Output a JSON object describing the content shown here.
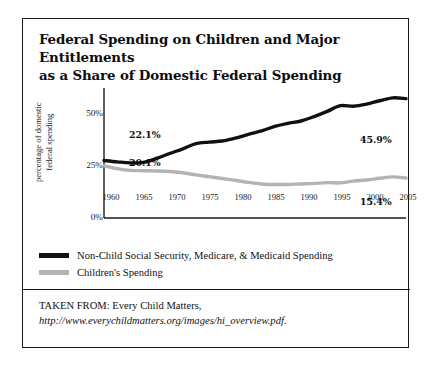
{
  "figure": {
    "title_line1": "Federal Spending on Children and Major Entitlements",
    "title_line2": "as a Share of Domestic Federal Spending",
    "source_prefix": "TAKEN FROM: Every Child Matters,",
    "source_url": "http://www.everychildmatters.org/images/hi_overview.pdf."
  },
  "colors": {
    "series_black": "#111111",
    "series_gray": "#b3b3b3",
    "axis": "#1a1a1a",
    "frame": "#1a1a1a",
    "text": "#111111",
    "background": "#ffffff"
  },
  "chart_data": {
    "type": "line",
    "title": "Federal Spending on Children and Major Entitlements as a Share of Domestic Federal Spending",
    "xlabel": "",
    "ylabel": "percentage of domestic federal spending",
    "ylabel_line1": "percentage of domestic",
    "ylabel_line2": "federal spending",
    "xlim": [
      1960,
      2006
    ],
    "ylim": [
      0,
      50
    ],
    "yticks": [
      0,
      25,
      50
    ],
    "ytick_labels": [
      "0%",
      "25%",
      "50%"
    ],
    "xticks": [
      1960,
      1965,
      1970,
      1975,
      1980,
      1985,
      1990,
      1995,
      2000,
      2005
    ],
    "xtick_labels": [
      "1960",
      "1965",
      "1970",
      "1975",
      "1980",
      "1985",
      "1990",
      "1995",
      "2000",
      "2005"
    ],
    "grid": false,
    "legend_position": "below",
    "annotations": [
      {
        "text": "22.1%",
        "series": "Non-Child Social Security, Medicare, & Medicaid Spending",
        "x": 1960,
        "y": 22.1,
        "placement": "above-right"
      },
      {
        "text": "20.1%",
        "series": "Children's Spending",
        "x": 1960,
        "y": 20.1,
        "placement": "below-right"
      },
      {
        "text": "45.9%",
        "series": "Non-Child Social Security, Medicare, & Medicaid Spending",
        "x": 2006,
        "y": 45.9,
        "placement": "below-left"
      },
      {
        "text": "15.4%",
        "series": "Children's Spending",
        "x": 2006,
        "y": 15.4,
        "placement": "below-left"
      }
    ],
    "series": [
      {
        "name": "Non-Child Social Security, Medicare, & Medicaid Spending",
        "color": "#111111",
        "x": [
          1960,
          1962,
          1964,
          1966,
          1968,
          1970,
          1972,
          1974,
          1976,
          1978,
          1980,
          1982,
          1984,
          1986,
          1988,
          1990,
          1992,
          1994,
          1996,
          1998,
          2000,
          2002,
          2004,
          2006
        ],
        "values": [
          22.1,
          21.6,
          21.2,
          21.4,
          22.9,
          24.8,
          26.6,
          28.6,
          29.2,
          29.6,
          30.7,
          32.2,
          33.5,
          35.2,
          36.4,
          37.3,
          39.0,
          41.0,
          43.2,
          43.0,
          43.8,
          45.1,
          46.2,
          45.9
        ]
      },
      {
        "name": "Children's Spending",
        "color": "#b3b3b3",
        "x": [
          1960,
          1962,
          1964,
          1966,
          1968,
          1970,
          1972,
          1974,
          1976,
          1978,
          1980,
          1982,
          1984,
          1986,
          1988,
          1990,
          1992,
          1994,
          1996,
          1998,
          2000,
          2002,
          2004,
          2006
        ],
        "values": [
          20.1,
          19.0,
          18.3,
          18.2,
          18.1,
          17.9,
          17.4,
          16.6,
          15.9,
          15.2,
          14.5,
          13.7,
          13.1,
          12.9,
          12.9,
          13.1,
          13.3,
          13.6,
          13.5,
          14.2,
          14.6,
          15.3,
          15.8,
          15.4
        ]
      }
    ]
  },
  "legend": {
    "items": [
      {
        "label": "Non-Child Social Security, Medicare, & Medicaid Spending",
        "color": "#111111"
      },
      {
        "label": "Children's Spending",
        "color": "#b3b3b3"
      }
    ]
  }
}
